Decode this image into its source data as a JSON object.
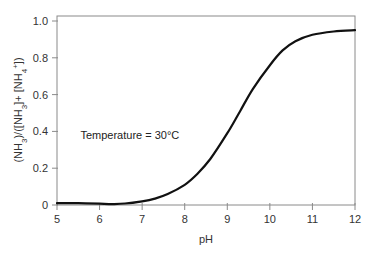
{
  "chart_data": {
    "type": "line",
    "title": "",
    "xlabel": "pH",
    "ylabel": "(NH3)/([NH3]+ [NH4+])",
    "ylabel_parts": [
      "(NH",
      "3",
      ")/([NH",
      "3",
      "]+ [NH",
      "4",
      "+",
      "])"
    ],
    "xlim": [
      5,
      12
    ],
    "ylim": [
      0,
      1.0
    ],
    "x_ticks": [
      5,
      6,
      7,
      8,
      9,
      10,
      11,
      12
    ],
    "x_tick_labels": [
      "5",
      "6",
      "7",
      "8",
      "9",
      "10",
      "11",
      "12"
    ],
    "y_ticks": [
      0,
      0.2,
      0.4,
      0.6,
      0.8,
      1.0
    ],
    "y_tick_labels": [
      "0",
      "0.2",
      "0.4",
      "0.6",
      "0.8",
      "1.0"
    ],
    "grid": false,
    "legend": null,
    "annotations": [
      {
        "text": "Temperature = 30°C",
        "x": 5.55,
        "y": 0.36
      }
    ],
    "series": [
      {
        "name": "NH3 fraction",
        "color": "#111111",
        "x": [
          5.0,
          5.5,
          6.0,
          6.3,
          6.6,
          7.0,
          7.3,
          7.6,
          8.0,
          8.3,
          8.6,
          9.0,
          9.3,
          9.6,
          10.0,
          10.3,
          10.6,
          11.0,
          11.5,
          12.0
        ],
        "y": [
          0.01,
          0.01,
          0.007,
          0.005,
          0.008,
          0.02,
          0.035,
          0.06,
          0.11,
          0.17,
          0.25,
          0.39,
          0.51,
          0.63,
          0.76,
          0.84,
          0.89,
          0.925,
          0.943,
          0.95
        ]
      }
    ]
  }
}
